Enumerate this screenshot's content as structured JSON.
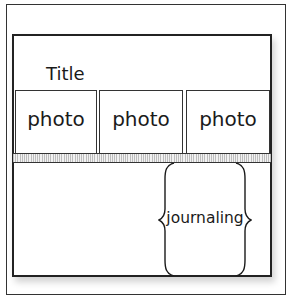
{
  "layout": {
    "title": "Title",
    "photos": [
      {
        "label": "photo"
      },
      {
        "label": "photo"
      },
      {
        "label": "photo"
      }
    ],
    "journaling": {
      "label": "journaling"
    },
    "colors": {
      "border": "#222222",
      "stripe_dark": "#bdbdbd",
      "stripe_light": "#f2f2f2",
      "background": "#ffffff"
    }
  }
}
